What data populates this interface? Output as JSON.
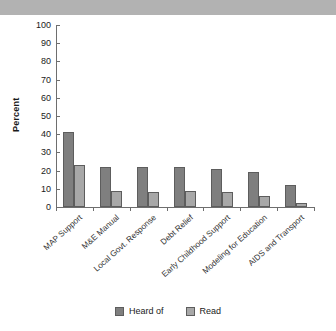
{
  "banner": {
    "present": true,
    "color": "#b2b2b2"
  },
  "chart_data": {
    "type": "bar",
    "title": "",
    "xlabel": "",
    "ylabel": "Percent",
    "ylim": [
      0,
      100
    ],
    "ytick_step": 10,
    "yticks": [
      100,
      90,
      80,
      70,
      60,
      50,
      40,
      30,
      20,
      10,
      0
    ],
    "grid": false,
    "legend_position": "bottom",
    "categories": [
      "MAP Support",
      "M&E Manual",
      "Local Govt. Response",
      "Debt Relief",
      "Early Childhood Support",
      "Modeling for Education",
      "AIDS and Transport"
    ],
    "series": [
      {
        "name": "Heard of",
        "color": "#7f7f7f",
        "values": [
          41,
          22,
          22,
          22,
          21,
          19,
          12
        ]
      },
      {
        "name": "Read",
        "color": "#a8a8a8",
        "values": [
          23,
          9,
          8,
          9,
          8,
          6,
          2
        ]
      }
    ]
  }
}
